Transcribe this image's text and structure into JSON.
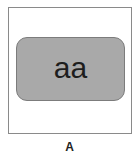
{
  "panel": {
    "inner_text": "aa",
    "caption": "A",
    "colors": {
      "outer_border": "#8a8a8a",
      "inner_fill": "#a9a9a9",
      "inner_border": "#7c7c7c",
      "text": "#1e1e1e"
    }
  }
}
